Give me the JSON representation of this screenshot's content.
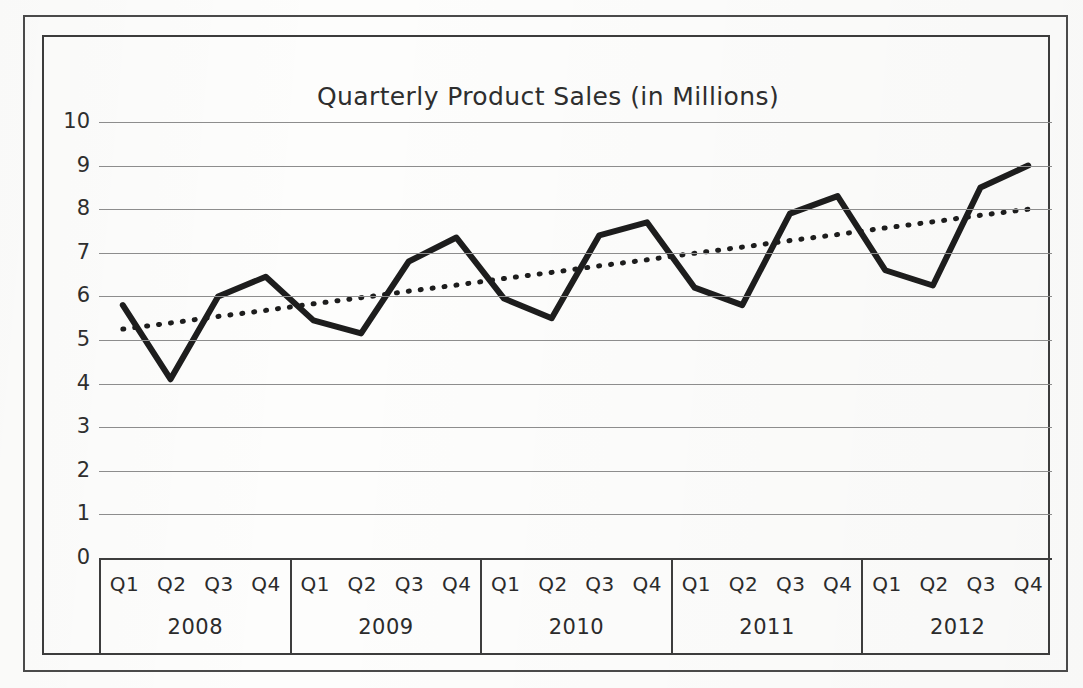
{
  "chart_data": {
    "type": "line",
    "title": "Quarterly Product Sales (in Millions)",
    "xlabel": "",
    "ylabel": "",
    "ylim": [
      0,
      10
    ],
    "ytick_step": 1,
    "yticks": [
      "10",
      "9",
      "8",
      "7",
      "6",
      "5",
      "4",
      "3",
      "2",
      "1",
      "0"
    ],
    "grid": true,
    "legend": "none",
    "categories": [
      "Q1 2008",
      "Q2 2008",
      "Q3 2008",
      "Q4 2008",
      "Q1 2009",
      "Q2 2009",
      "Q3 2009",
      "Q4 2009",
      "Q1 2010",
      "Q2 2010",
      "Q3 2010",
      "Q4 2010",
      "Q1 2011",
      "Q2 2011",
      "Q3 2011",
      "Q4 2011",
      "Q1 2012",
      "Q2 2012",
      "Q3 2012",
      "Q4 2012"
    ],
    "quarters": [
      "Q1",
      "Q2",
      "Q3",
      "Q4"
    ],
    "years": [
      "2008",
      "2009",
      "2010",
      "2011",
      "2012"
    ],
    "series": [
      {
        "name": "Sales",
        "style": "solid",
        "color": "#1d1d1d",
        "values": [
          5.8,
          4.1,
          6.0,
          6.45,
          5.45,
          5.15,
          6.8,
          7.35,
          5.95,
          5.5,
          7.4,
          7.7,
          6.2,
          5.8,
          7.9,
          8.3,
          6.6,
          6.25,
          8.5,
          9.0
        ]
      },
      {
        "name": "Trend",
        "style": "dotted",
        "color": "#1d1d1d",
        "values": [
          5.25,
          5.39,
          5.54,
          5.68,
          5.83,
          5.97,
          6.12,
          6.26,
          6.41,
          6.55,
          6.7,
          6.84,
          6.99,
          7.13,
          7.28,
          7.42,
          7.57,
          7.71,
          7.86,
          8.0
        ]
      }
    ]
  },
  "colors": {
    "series_line": "#1d1d1d",
    "trend_line": "#1d1d1d",
    "gridline": "#8d8d8d",
    "frame": "#3c3c3c",
    "text": "#2e2e2e",
    "background": "#fdfdfc"
  }
}
